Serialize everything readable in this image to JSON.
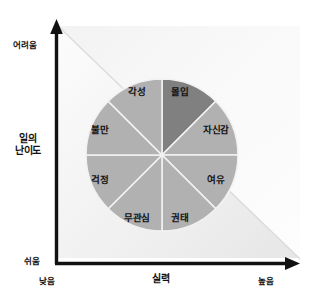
{
  "chart_data": {
    "type": "pie",
    "title": "",
    "xlabel": "실력",
    "ylabel": "일의 난이도",
    "x_ticks": [
      "낮음",
      "높음"
    ],
    "y_ticks": [
      "쉬움",
      "어려움"
    ],
    "xlim": [
      0,
      1
    ],
    "ylim": [
      0,
      1
    ],
    "grid": false,
    "legend": "none",
    "center": [
      162,
      155
    ],
    "radius": 76,
    "categories": [
      "몰입",
      "자신감",
      "여유",
      "권태",
      "무관심",
      "걱정",
      "불만",
      "각성"
    ],
    "values": [
      12.5,
      12.5,
      12.5,
      12.5,
      12.5,
      12.5,
      12.5,
      12.5
    ],
    "slices": [
      {
        "label": "몰입",
        "value": 12.5,
        "start_deg": 0,
        "end_deg": 45,
        "color": "#808080",
        "highlighted": true,
        "label_x": 180,
        "label_y": 92
      },
      {
        "label": "자신감",
        "value": 12.5,
        "start_deg": 45,
        "end_deg": 90,
        "color": "#b1b1b1",
        "highlighted": false,
        "label_x": 216,
        "label_y": 130
      },
      {
        "label": "여유",
        "value": 12.5,
        "start_deg": 90,
        "end_deg": 135,
        "color": "#b1b1b1",
        "highlighted": false,
        "label_x": 216,
        "label_y": 180
      },
      {
        "label": "권태",
        "value": 12.5,
        "start_deg": 135,
        "end_deg": 180,
        "color": "#b1b1b1",
        "highlighted": false,
        "label_x": 180,
        "label_y": 218
      },
      {
        "label": "무관심",
        "value": 12.5,
        "start_deg": 180,
        "end_deg": 225,
        "color": "#b1b1b1",
        "highlighted": false,
        "label_x": 137,
        "label_y": 218
      },
      {
        "label": "걱정",
        "value": 12.5,
        "start_deg": 225,
        "end_deg": 270,
        "color": "#b1b1b1",
        "highlighted": false,
        "label_x": 100,
        "label_y": 180
      },
      {
        "label": "불만",
        "value": 12.5,
        "start_deg": 270,
        "end_deg": 315,
        "color": "#b1b1b1",
        "highlighted": false,
        "label_x": 100,
        "label_y": 130
      },
      {
        "label": "각성",
        "value": 12.5,
        "start_deg": 315,
        "end_deg": 360,
        "color": "#b1b1b1",
        "highlighted": false,
        "label_x": 137,
        "label_y": 92
      }
    ],
    "colors": {
      "highlight_slice": "#808080",
      "normal_slice": "#b1b1b1",
      "slice_divider": "#f2f2f2",
      "axis": "#111111",
      "background": "#ffffff",
      "band_light": "#ededed",
      "text": "#111111"
    }
  },
  "axes": {
    "y": {
      "title_line1": "일의",
      "title_line2": "난이도",
      "top_label": "어려움",
      "bottom_label": "쉬움"
    },
    "x": {
      "title": "실력",
      "left_label": "낮음",
      "right_label": "높음"
    }
  },
  "sectors": {
    "flow": "몰입",
    "confidence": "자신감",
    "relaxation": "여유",
    "boredom": "권태",
    "apathy": "무관심",
    "worry": "걱정",
    "anxiety": "불만",
    "arousal": "각성"
  }
}
